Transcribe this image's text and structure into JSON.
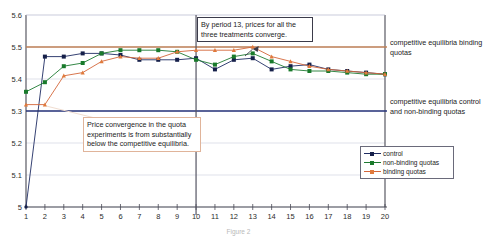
{
  "chart_data": {
    "type": "line",
    "title": "",
    "xlabel": "",
    "ylabel": "",
    "x": [
      1,
      2,
      3,
      4,
      5,
      6,
      7,
      8,
      9,
      10,
      11,
      12,
      13,
      14,
      15,
      16,
      17,
      18,
      19,
      20
    ],
    "xlim": [
      1,
      20
    ],
    "ylim": [
      5.0,
      5.6
    ],
    "yticks": [
      "5",
      "5.1",
      "5.2",
      "5.3",
      "5.4",
      "5.5",
      "5.6"
    ],
    "xticks": [
      "1",
      "2",
      "3",
      "4",
      "5",
      "6",
      "7",
      "8",
      "9",
      "10",
      "11",
      "12",
      "13",
      "14",
      "15",
      "16",
      "17",
      "18",
      "19",
      "20"
    ],
    "grid": true,
    "legend_position": "bottom-right",
    "series": [
      {
        "name": "control",
        "color": "#16204a",
        "values": [
          5.0,
          5.47,
          5.47,
          5.48,
          5.48,
          5.475,
          5.46,
          5.46,
          5.46,
          5.465,
          5.43,
          5.46,
          5.465,
          5.43,
          5.44,
          5.445,
          5.43,
          5.425,
          5.42,
          5.415
        ]
      },
      {
        "name": "non-binding quotas",
        "color": "#197a2b",
        "values": [
          5.36,
          5.39,
          5.44,
          5.45,
          5.48,
          5.49,
          5.49,
          5.49,
          5.485,
          5.46,
          5.445,
          5.47,
          5.48,
          5.455,
          5.43,
          5.425,
          5.425,
          5.42,
          5.415,
          5.415
        ]
      },
      {
        "name": "binding quotas",
        "color": "#e07a3c",
        "values": [
          5.32,
          5.32,
          5.41,
          5.42,
          5.455,
          5.47,
          5.465,
          5.465,
          5.485,
          5.49,
          5.49,
          5.49,
          5.5,
          5.47,
          5.455,
          5.44,
          5.43,
          5.425,
          5.42,
          5.415
        ]
      }
    ],
    "reference_lines": [
      {
        "name": "competitive-equilibria-binding-quotas",
        "value": 5.5,
        "color": "#c08257",
        "label": "competitive equilibria binding quotas"
      },
      {
        "name": "competitive-equilibria-control-nonbinding",
        "value": 5.3,
        "color": "#27357a",
        "label": "competitive equilibria control and non-binding quotas"
      }
    ],
    "vertical_divider": {
      "x": 10,
      "color": "#555563"
    },
    "annotations": [
      {
        "name": "convergence-note",
        "text": "By period 13, prices for all the three treatments converge.",
        "points_to_x": 13
      },
      {
        "name": "below-equilibria-note",
        "text": "Price convergence in the quota experiments is from substantially below the competitive equilibria.",
        "points_to_x": 2
      }
    ]
  },
  "right_labels": {
    "binding": "competitive equilibria binding quotas",
    "control": "competitive equilibria control and non-binding quotas"
  },
  "legend": {
    "items": [
      {
        "label": "control",
        "color": "#16204a",
        "line": "#1f2d63"
      },
      {
        "label": "non-binding quotas",
        "color": "#197a2b",
        "line": "#1e7a32"
      },
      {
        "label": "binding quotas",
        "color": "#e07a3c",
        "line": "#d4663a"
      }
    ]
  },
  "caption": "Figure 2"
}
